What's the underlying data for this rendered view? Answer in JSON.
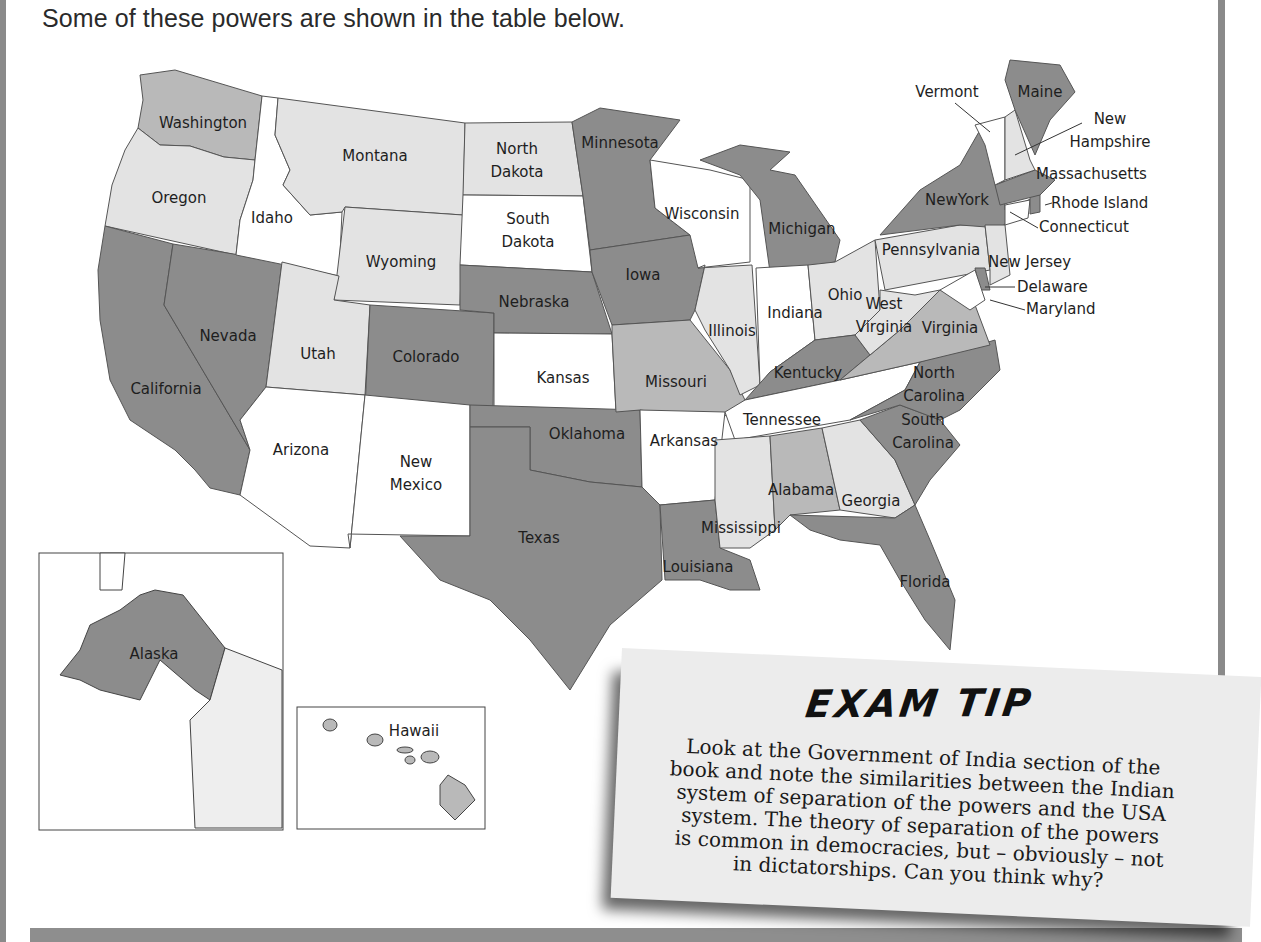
{
  "page": {
    "intro_text": "Some of these powers are shown in the table below."
  },
  "map": {
    "shade_colors": {
      "dark": "#8c8c8c",
      "medium": "#b9b9b9",
      "light": "#e3e3e3",
      "white": "#ffffff"
    },
    "states": [
      {
        "name": "Washington",
        "shade": "medium"
      },
      {
        "name": "Oregon",
        "shade": "light"
      },
      {
        "name": "California",
        "shade": "dark"
      },
      {
        "name": "Nevada",
        "shade": "dark"
      },
      {
        "name": "Idaho",
        "shade": "white"
      },
      {
        "name": "Montana",
        "shade": "light"
      },
      {
        "name": "Wyoming",
        "shade": "light"
      },
      {
        "name": "Utah",
        "shade": "light"
      },
      {
        "name": "Arizona",
        "shade": "white"
      },
      {
        "name": "Colorado",
        "shade": "dark"
      },
      {
        "name": "New Mexico",
        "shade": "white"
      },
      {
        "name": "North Dakota",
        "shade": "light"
      },
      {
        "name": "South Dakota",
        "shade": "white"
      },
      {
        "name": "Nebraska",
        "shade": "dark"
      },
      {
        "name": "Kansas",
        "shade": "white"
      },
      {
        "name": "Oklahoma",
        "shade": "dark"
      },
      {
        "name": "Texas",
        "shade": "dark"
      },
      {
        "name": "Minnesota",
        "shade": "dark"
      },
      {
        "name": "Iowa",
        "shade": "dark"
      },
      {
        "name": "Missouri",
        "shade": "medium"
      },
      {
        "name": "Arkansas",
        "shade": "white"
      },
      {
        "name": "Louisiana",
        "shade": "dark"
      },
      {
        "name": "Wisconsin",
        "shade": "white"
      },
      {
        "name": "Illinois",
        "shade": "light"
      },
      {
        "name": "Michigan",
        "shade": "dark"
      },
      {
        "name": "Indiana",
        "shade": "white"
      },
      {
        "name": "Ohio",
        "shade": "light"
      },
      {
        "name": "Kentucky",
        "shade": "dark"
      },
      {
        "name": "Tennessee",
        "shade": "white"
      },
      {
        "name": "Mississippi",
        "shade": "light"
      },
      {
        "name": "Alabama",
        "shade": "medium"
      },
      {
        "name": "Georgia",
        "shade": "light"
      },
      {
        "name": "Florida",
        "shade": "dark"
      },
      {
        "name": "South Carolina",
        "shade": "dark"
      },
      {
        "name": "North Carolina",
        "shade": "dark"
      },
      {
        "name": "Virginia",
        "shade": "medium"
      },
      {
        "name": "West Virginia",
        "shade": "light"
      },
      {
        "name": "Pennsylvania",
        "shade": "light"
      },
      {
        "name": "New York",
        "shade": "dark"
      },
      {
        "name": "New Jersey",
        "shade": "light"
      },
      {
        "name": "Delaware",
        "shade": "dark"
      },
      {
        "name": "Maryland",
        "shade": "white"
      },
      {
        "name": "Connecticut",
        "shade": "white"
      },
      {
        "name": "Rhode Island",
        "shade": "dark"
      },
      {
        "name": "Massachusetts",
        "shade": "dark"
      },
      {
        "name": "Vermont",
        "shade": "white"
      },
      {
        "name": "New Hampshire",
        "shade": "light"
      },
      {
        "name": "Maine",
        "shade": "dark"
      },
      {
        "name": "Alaska",
        "shade": "dark"
      },
      {
        "name": "Hawaii",
        "shade": "medium"
      }
    ],
    "labels": {
      "washington": "Washington",
      "oregon": "Oregon",
      "california": "California",
      "nevada": "Nevada",
      "idaho": "Idaho",
      "montana": "Montana",
      "wyoming": "Wyoming",
      "utah": "Utah",
      "arizona": "Arizona",
      "colorado": "Colorado",
      "new_mexico_1": "New",
      "new_mexico_2": "Mexico",
      "north_dakota_1": "North",
      "north_dakota_2": "Dakota",
      "south_dakota_1": "South",
      "south_dakota_2": "Dakota",
      "nebraska": "Nebraska",
      "kansas": "Kansas",
      "oklahoma": "Oklahoma",
      "texas": "Texas",
      "minnesota": "Minnesota",
      "iowa": "Iowa",
      "missouri": "Missouri",
      "arkansas": "Arkansas",
      "louisiana": "Louisiana",
      "wisconsin": "Wisconsin",
      "illinois": "Illinois",
      "michigan": "Michigan",
      "indiana": "Indiana",
      "ohio": "Ohio",
      "kentucky": "Kentucky",
      "tennessee": "Tennessee",
      "mississippi": "Mississippi",
      "alabama": "Alabama",
      "georgia": "Georgia",
      "florida": "Florida",
      "south_carolina_1": "South",
      "south_carolina_2": "Carolina",
      "north_carolina_1": "North",
      "north_carolina_2": "Carolina",
      "virginia": "Virginia",
      "west_virginia_1": "West",
      "west_virginia_2": "Virginia",
      "pennsylvania": "Pennsylvania",
      "new_york": "NewYork",
      "new_jersey": "New Jersey",
      "delaware": "Delaware",
      "maryland": "Maryland",
      "connecticut": "Connecticut",
      "rhode_island": "Rhode Island",
      "massachusetts": "Massachusetts",
      "vermont": "Vermont",
      "new_hampshire_1": "New",
      "new_hampshire_2": "Hampshire",
      "maine": "Maine",
      "alaska": "Alaska",
      "hawaii": "Hawaii"
    }
  },
  "exam_tip": {
    "title": "EXAM TIP",
    "lines": [
      "Look at the Government of India section of the",
      "book and note the similarities between the Indian",
      "system of separation of the powers and the USA",
      "system. The theory of separation of the powers",
      "is common in democracies, but – obviously – not",
      "in dictatorships. Can you think why?"
    ]
  }
}
